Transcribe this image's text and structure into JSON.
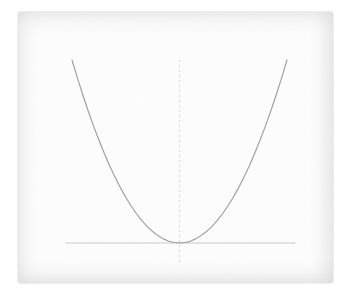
{
  "figure": {
    "description_visible_text": "",
    "colors": {
      "canvas_background": "#ffffff",
      "page_background": "#fdfdfd",
      "page_edge": "#ededed",
      "curve": "#9b9b9b",
      "x_axis": "#c8c8c8",
      "y_axis": "#d6d6d6"
    }
  },
  "chart_data": {
    "type": "line",
    "title": "",
    "xlabel": "",
    "ylabel": "",
    "tick_labels": "none",
    "grid": false,
    "legend": false,
    "xlim": [
      -1.06,
      1.08
    ],
    "ylim": [
      -0.11,
      1.0
    ],
    "x_axis_style": "solid",
    "y_axis_style": "dashed",
    "x": [
      -1.0,
      -0.95,
      -0.9,
      -0.85,
      -0.8,
      -0.75,
      -0.7,
      -0.65,
      -0.6,
      -0.55,
      -0.5,
      -0.45,
      -0.4,
      -0.35,
      -0.3,
      -0.25,
      -0.2,
      -0.15,
      -0.1,
      -0.05,
      0.0,
      0.05,
      0.1,
      0.15,
      0.2,
      0.25,
      0.3,
      0.35,
      0.4,
      0.45,
      0.5,
      0.55,
      0.6,
      0.65,
      0.7,
      0.75,
      0.8,
      0.85,
      0.9,
      0.95,
      1.0
    ],
    "series": [
      {
        "name": "parabola y = x^2",
        "values": [
          1.0,
          0.9025,
          0.81,
          0.7225,
          0.64,
          0.5625,
          0.49,
          0.4225,
          0.36,
          0.3025,
          0.25,
          0.2025,
          0.16,
          0.1225,
          0.09,
          0.0625,
          0.04,
          0.0225,
          0.01,
          0.0025,
          0.0,
          0.0025,
          0.01,
          0.0225,
          0.04,
          0.0625,
          0.09,
          0.1225,
          0.16,
          0.2025,
          0.25,
          0.3025,
          0.36,
          0.4225,
          0.49,
          0.5625,
          0.64,
          0.7225,
          0.81,
          0.9025,
          1.0
        ]
      }
    ]
  }
}
